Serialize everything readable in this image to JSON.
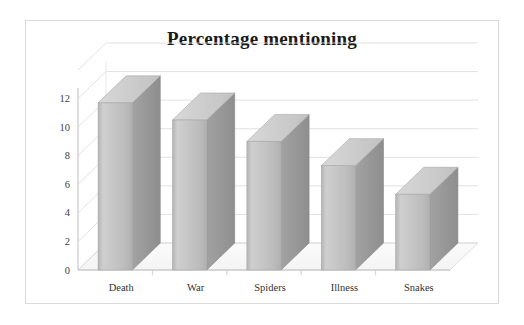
{
  "chart_data": {
    "type": "bar",
    "title": "Percentage mentioning",
    "subtitle": "",
    "xlabel": "",
    "ylabel": "",
    "categories": [
      "Death",
      "War",
      "Spiders",
      "Illness",
      "Snakes"
    ],
    "values": [
      11.7,
      10.5,
      9.0,
      7.3,
      5.3
    ],
    "series": [
      {
        "name": "Percentage mentioning",
        "values": [
          11.7,
          10.5,
          9.0,
          7.3,
          5.3
        ]
      }
    ],
    "ylim": [
      0,
      14
    ],
    "yticks": [
      0,
      2,
      4,
      6,
      8,
      10,
      12
    ],
    "ytick_labels": [
      "0",
      "2",
      "4",
      "6",
      "8",
      "10",
      "12"
    ],
    "grid": true,
    "grid_axis": "y",
    "legend": false,
    "legend_position": "none",
    "style": "3d-column",
    "bar_color": "#bfbfbf",
    "bar_side_color": "#9a9a9a",
    "bar_top_color": "#d4d4d4",
    "grid_color": "#d9d9d9",
    "axis_color": "#bfbfbf",
    "title_color": "#1a1a1a",
    "background": "#ffffff",
    "frame_color": "#d9d9d9"
  },
  "axis": {
    "y_ticks": [
      {
        "label": "12",
        "value": 12
      },
      {
        "label": "10",
        "value": 10
      },
      {
        "label": "8",
        "value": 8
      },
      {
        "label": "6",
        "value": 6
      },
      {
        "label": "4",
        "value": 4
      },
      {
        "label": "2",
        "value": 2
      },
      {
        "label": "0",
        "value": 0
      }
    ],
    "x_categories": [
      {
        "label": "Death"
      },
      {
        "label": "War"
      },
      {
        "label": "Spiders"
      },
      {
        "label": "Illness"
      },
      {
        "label": "Snakes"
      }
    ]
  }
}
